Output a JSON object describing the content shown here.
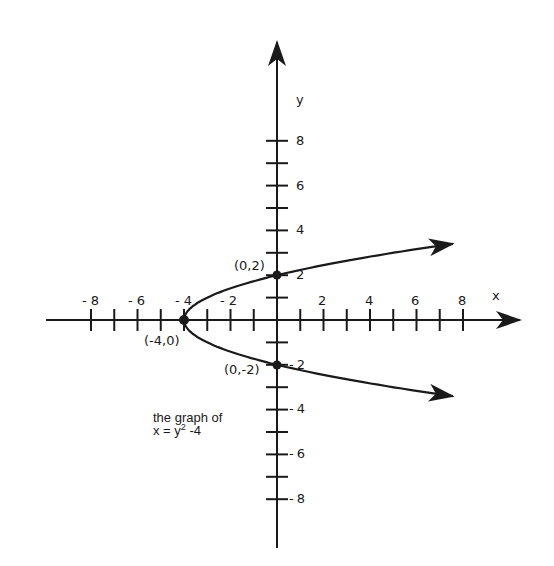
{
  "figure": {
    "caption_line1": "the graph of",
    "caption_line2": "x = y",
    "caption_sup": "2",
    "caption_tail": " -4",
    "x_axis_label": "x",
    "y_axis_label": "y",
    "x_tick_labels": [
      "- 8",
      "- 6",
      "- 4",
      "- 2",
      "2",
      "4",
      "6",
      "8"
    ],
    "y_tick_labels_pos": [
      "2",
      "4",
      "6",
      "8"
    ],
    "y_tick_labels_neg": [
      "2",
      "4",
      "6",
      "8"
    ],
    "points": [
      {
        "label": "(0,2)",
        "x": 0,
        "y": 2
      },
      {
        "label": "(-4,0)",
        "x": -4,
        "y": 0
      },
      {
        "label": "(0,-2)",
        "x": 0,
        "y": -2
      }
    ]
  },
  "chart_data": {
    "type": "line",
    "xlabel": "x",
    "ylabel": "y",
    "xlim": [
      -9,
      10
    ],
    "ylim": [
      -9,
      10
    ],
    "x_ticks": [
      -8,
      -7,
      -6,
      -5,
      -4,
      -3,
      -2,
      -1,
      1,
      2,
      3,
      4,
      5,
      6,
      7,
      8
    ],
    "y_ticks": [
      -8,
      -7,
      -6,
      -5,
      -4,
      -3,
      -2,
      -1,
      1,
      2,
      3,
      4,
      5,
      6,
      7,
      8
    ],
    "series": [
      {
        "name": "x = y^2 - 4",
        "equation": "x = y^2 - 4",
        "x": [
          7.6,
          5,
          2.25,
          0,
          -1.75,
          -3,
          -3.75,
          -4,
          -3.75,
          -3,
          -1.75,
          0,
          2.25,
          5,
          7.6
        ],
        "y": [
          3.4,
          3,
          2.5,
          2,
          1.5,
          1,
          0.5,
          0,
          -0.5,
          -1,
          -1.5,
          -2,
          -2.5,
          -3,
          -3.4
        ]
      }
    ],
    "annotations": [
      "(0,2)",
      "(-4,0)",
      "(0,-2)",
      "the graph of x = y^2 - 4"
    ],
    "grid": false
  }
}
